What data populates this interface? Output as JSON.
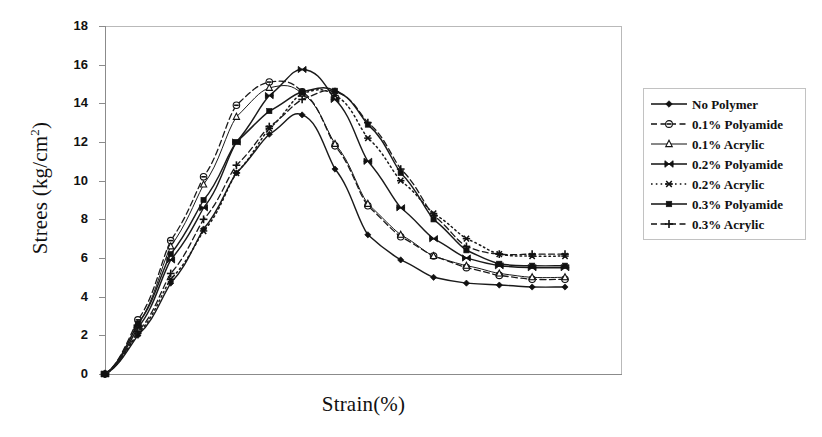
{
  "axes": {
    "y_title": "Strees (kg/cm",
    "y_title_sup": "2",
    "y_title_tail": ")",
    "x_title": "Strain(%)",
    "y_ticks": [
      "18",
      "16",
      "14",
      "12",
      "10",
      "8",
      "6",
      "4",
      "2",
      "0"
    ]
  },
  "legend": {
    "items": [
      {
        "label": "No Polymer",
        "marker": "diamond-filled-icon",
        "dash": "solid"
      },
      {
        "label": "0.1% Polyamide",
        "marker": "circle-dot-icon",
        "dash": "dashed"
      },
      {
        "label": "0.1% Acrylic",
        "marker": "triangle-icon",
        "dash": "solid-thin"
      },
      {
        "label": "0.2% Polyamide",
        "marker": "bowtie-x-icon",
        "dash": "solid"
      },
      {
        "label": "0.2% Acrylic",
        "marker": "asterisk-icon",
        "dash": "dotted"
      },
      {
        "label": "0.3% Polyamide",
        "marker": "square-filled-icon",
        "dash": "solid"
      },
      {
        "label": "0.3% Acrylic",
        "marker": "plus-icon",
        "dash": "dashed"
      }
    ]
  },
  "chart_data": {
    "type": "line",
    "title": "",
    "xlabel": "Strain(%)",
    "ylabel": "Strees (kg/cm2)",
    "ylim": [
      0,
      18
    ],
    "ytick_step": 2,
    "xlim": [
      0,
      16
    ],
    "x_tick_labels": [],
    "grid": false,
    "legend_position": "right-outside",
    "line_color": "#1a1a1a",
    "series": [
      {
        "name": "No Polymer",
        "marker": "diamond-filled",
        "dash": "solid",
        "x": [
          0,
          1,
          2,
          3,
          4,
          5,
          6,
          7,
          8,
          9,
          10,
          11,
          12,
          13,
          14
        ],
        "y": [
          0,
          2.0,
          4.7,
          7.5,
          10.4,
          12.4,
          13.4,
          10.6,
          7.2,
          5.9,
          5.0,
          4.7,
          4.6,
          4.5,
          4.5
        ]
      },
      {
        "name": "0.1% Polyamide",
        "marker": "circle-dot",
        "dash": "dashed",
        "x": [
          0,
          1,
          2,
          3,
          4,
          5,
          6,
          7,
          8,
          9,
          10,
          11,
          12,
          13,
          14
        ],
        "y": [
          0,
          2.8,
          6.9,
          10.2,
          13.9,
          15.1,
          14.6,
          11.8,
          8.7,
          7.1,
          6.1,
          5.5,
          5.1,
          4.9,
          4.9
        ]
      },
      {
        "name": "0.1% Acrylic",
        "marker": "triangle",
        "dash": "solid-thin",
        "x": [
          0,
          1,
          2,
          3,
          4,
          5,
          6,
          7,
          8,
          9,
          10,
          11,
          12,
          13,
          14
        ],
        "y": [
          0,
          2.6,
          6.6,
          9.8,
          13.3,
          14.8,
          14.5,
          11.9,
          8.8,
          7.2,
          6.1,
          5.6,
          5.2,
          5.0,
          5.0
        ]
      },
      {
        "name": "0.2% Polyamide",
        "marker": "bowtie-x",
        "dash": "solid",
        "x": [
          0,
          1,
          2,
          3,
          4,
          5,
          6,
          7,
          8,
          9,
          10,
          11,
          12,
          13,
          14
        ],
        "y": [
          0,
          2.4,
          5.9,
          8.6,
          12.0,
          14.4,
          15.75,
          14.2,
          11.0,
          8.6,
          7.0,
          6.0,
          5.6,
          5.5,
          5.5
        ]
      },
      {
        "name": "0.2% Acrylic",
        "marker": "asterisk",
        "dash": "dotted",
        "x": [
          0,
          1,
          2,
          3,
          4,
          5,
          6,
          7,
          8,
          9,
          10,
          11,
          12,
          13,
          14
        ],
        "y": [
          0,
          2.1,
          4.9,
          7.4,
          10.4,
          12.7,
          14.5,
          14.4,
          12.2,
          10.0,
          8.3,
          7.0,
          6.2,
          6.1,
          6.1
        ]
      },
      {
        "name": "0.3% Polyamide",
        "marker": "square-filled",
        "dash": "solid",
        "x": [
          0,
          1,
          2,
          3,
          4,
          5,
          6,
          7,
          8,
          9,
          10,
          11,
          12,
          13,
          14
        ],
        "y": [
          0,
          2.6,
          6.2,
          9.0,
          12.0,
          13.6,
          14.6,
          14.65,
          12.9,
          10.4,
          8.0,
          6.4,
          5.7,
          5.6,
          5.6
        ]
      },
      {
        "name": "0.3% Acrylic",
        "marker": "plus",
        "dash": "dashed",
        "x": [
          0,
          1,
          2,
          3,
          4,
          5,
          6,
          7,
          8,
          9,
          10,
          11,
          12,
          13,
          14
        ],
        "y": [
          0,
          2.2,
          5.2,
          8.0,
          10.8,
          12.8,
          14.2,
          14.6,
          13.0,
          10.6,
          8.2,
          6.6,
          6.2,
          6.2,
          6.2
        ]
      }
    ]
  }
}
